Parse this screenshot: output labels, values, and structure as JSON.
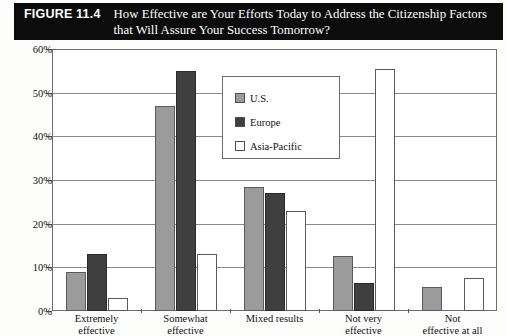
{
  "figure": {
    "number_label": "FIGURE 11.4",
    "title_line1": "How Effective are Your Efforts Today to Address the Citizenship Factors",
    "title_line2": "that Will Assure Your Success Tomorrow?"
  },
  "legend": {
    "items": [
      {
        "label": "U.S.",
        "color": "#9b9b9b",
        "swatch_name": "legend-swatch-us"
      },
      {
        "label": "Europe",
        "color": "#3f3f3f",
        "swatch_name": "legend-swatch-europe"
      },
      {
        "label": "Asia-Pacific",
        "color": "#ffffff",
        "swatch_name": "legend-swatch-asia-pacific"
      }
    ]
  },
  "axes": {
    "yticks": [
      "0%",
      "10%",
      "20%",
      "30%",
      "40%",
      "50%",
      "60%"
    ],
    "xcategories": [
      {
        "line1": "Extremely",
        "line2": "effective"
      },
      {
        "line1": "Somewhat",
        "line2": "effective"
      },
      {
        "line1": "Mixed results",
        "line2": ""
      },
      {
        "line1": "Not very",
        "line2": "effective"
      },
      {
        "line1": "Not",
        "line2": "effective at all"
      }
    ]
  },
  "chart_data": {
    "type": "bar",
    "title": "How Effective are Your Efforts Today to Address the Citizenship Factors that Will Assure Your Success Tomorrow?",
    "xlabel": "",
    "ylabel": "",
    "ylim": [
      0,
      60
    ],
    "ytick_values": [
      0,
      10,
      20,
      30,
      40,
      50,
      60
    ],
    "ytick_format": "percent",
    "grid": true,
    "legend_position": "center-top-inside",
    "categories": [
      "Extremely effective",
      "Somewhat effective",
      "Mixed results",
      "Not very effective",
      "Not effective at all"
    ],
    "series": [
      {
        "name": "U.S.",
        "color": "#9b9b9b",
        "values": [
          9,
          47,
          28.5,
          12.5,
          5.5
        ]
      },
      {
        "name": "Europe",
        "color": "#3f3f3f",
        "values": [
          13,
          55,
          27,
          6.5,
          0
        ]
      },
      {
        "name": "Asia-Pacific",
        "color": "#ffffff",
        "values": [
          3,
          13,
          23,
          55.5,
          7.5
        ]
      }
    ]
  }
}
